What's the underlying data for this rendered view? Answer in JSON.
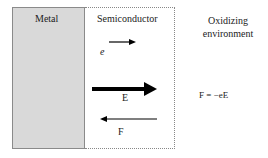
{
  "regions": {
    "metal": "Metal",
    "semiconductor": "Semiconductor",
    "environment_line1": "Oxidizing",
    "environment_line2": "environment"
  },
  "labels": {
    "electron": "e",
    "field": "E",
    "force": "F",
    "equation": "F = −eE"
  },
  "colors": {
    "metal_fill": "#d9d9d9",
    "arrow": "#000000"
  }
}
